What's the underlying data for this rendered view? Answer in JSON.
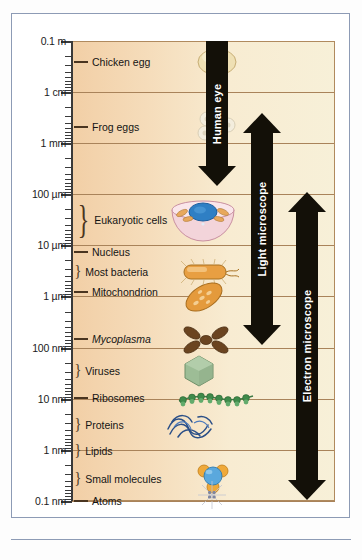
{
  "figure": {
    "background_left": "#f2cfa6",
    "background_right": "#f7f0d8",
    "frame_color": "#8d9bb5",
    "gridline_color": "#a9835a"
  },
  "scale": {
    "orientation": "vertical-logarithmic",
    "top_value": "0.1 m",
    "bottom_value": "0.1 nm",
    "decades": 9,
    "major_ticks": [
      {
        "label": "0.1 m",
        "y": 41
      },
      {
        "label": "1 cm",
        "y": 92
      },
      {
        "label": "1 mm",
        "y": 143
      },
      {
        "label": "100 µm",
        "y": 194
      },
      {
        "label": "10 µm",
        "y": 245
      },
      {
        "label": "1 µm",
        "y": 296
      },
      {
        "label": "100 nm",
        "y": 348
      },
      {
        "label": "10 nm",
        "y": 399
      },
      {
        "label": "1 nm",
        "y": 450
      },
      {
        "label": "0.1 nm",
        "y": 501
      }
    ]
  },
  "items": [
    {
      "label": "Chicken egg",
      "y": 62,
      "marker": "dash",
      "italic": false,
      "illustration": "chicken-egg"
    },
    {
      "label": "Frog eggs",
      "y": 127,
      "marker": "dash",
      "italic": false,
      "illustration": "frog-eggs"
    },
    {
      "label": "Eukaryotic cells",
      "y": 220,
      "marker": "tall-brace",
      "italic": false,
      "illustration": "eukaryotic-cell"
    },
    {
      "label": "Nucleus",
      "y": 252,
      "marker": "dash",
      "italic": false,
      "illustration": "none"
    },
    {
      "label": "Most bacteria",
      "y": 271,
      "marker": "brace",
      "italic": false,
      "illustration": "bacterium"
    },
    {
      "label": "Mitochondrion",
      "y": 292,
      "marker": "dash",
      "italic": false,
      "illustration": "mitochondrion"
    },
    {
      "label": "Mycoplasma",
      "y": 339,
      "marker": "dash",
      "italic": true,
      "illustration": "mycoplasma"
    },
    {
      "label": "Viruses",
      "y": 370,
      "marker": "brace",
      "italic": false,
      "illustration": "virus"
    },
    {
      "label": "Ribosomes",
      "y": 398,
      "marker": "dash",
      "italic": false,
      "illustration": "ribosomes"
    },
    {
      "label": "Proteins",
      "y": 424,
      "marker": "brace",
      "italic": false,
      "illustration": "protein"
    },
    {
      "label": "Lipids",
      "y": 450,
      "marker": "brace",
      "italic": false,
      "illustration": "none"
    },
    {
      "label": "Small molecules",
      "y": 478,
      "marker": "brace",
      "italic": false,
      "illustration": "small-molecule"
    },
    {
      "label": "Atoms",
      "y": 501,
      "marker": "dash",
      "italic": false,
      "illustration": "atom"
    }
  ],
  "range_arrows": [
    {
      "label": "Human eye",
      "top": 41,
      "bottom": 186,
      "direction": "down",
      "color": "#131008"
    },
    {
      "label": "Light microscope",
      "top": 113,
      "bottom": 345,
      "direction": "both",
      "color": "#131008"
    },
    {
      "label": "Electron microscope",
      "top": 192,
      "bottom": 500,
      "direction": "both",
      "color": "#131008"
    }
  ]
}
